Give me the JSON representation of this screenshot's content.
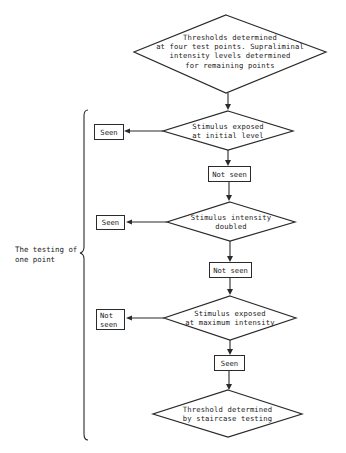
{
  "diagram": {
    "type": "flowchart",
    "start": {
      "line1": "Thresholds determined",
      "line2": "at four test points. Supraliminal",
      "line3": "intensity levels determined",
      "line4": "for remaining points"
    },
    "steps": [
      {
        "decision": {
          "line1": "Stimulus exposed",
          "line2": "at initial level"
        },
        "side_outcome": {
          "line1": "Seen",
          "line2": ""
        },
        "continue_outcome": "Not seen"
      },
      {
        "decision": {
          "line1": "Stimulus intensity",
          "line2": "doubled"
        },
        "side_outcome": {
          "line1": "Seen",
          "line2": ""
        },
        "continue_outcome": "Not seen"
      },
      {
        "decision": {
          "line1": "Stimulus exposed",
          "line2": "at maximum intensity"
        },
        "side_outcome": {
          "line1": "Not",
          "line2": "seen"
        },
        "continue_outcome": "Seen"
      }
    ],
    "end": {
      "line1": "Threshold determined",
      "line2": "by staircase testing"
    },
    "brace_label": {
      "line1": "The testing of",
      "line2": "one point"
    }
  }
}
